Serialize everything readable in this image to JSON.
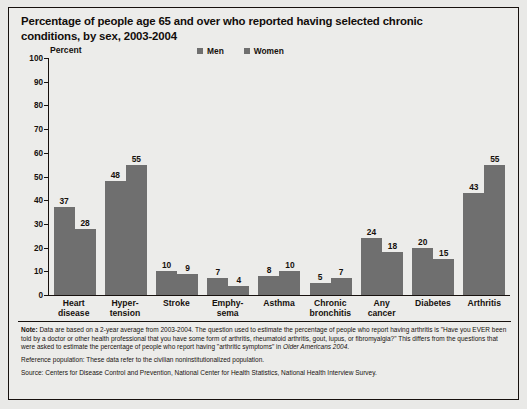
{
  "chart_data": {
    "type": "bar",
    "title": "Percentage of people age 65 and over who reported having selected chronic conditions, by sex, 2003-2004",
    "title_line1": "Percentage of people age 65 and over who reported having selected chronic",
    "title_line2": "conditions, by sex, 2003-2004",
    "ylabel": "Percent",
    "xlabel": "",
    "ylim": [
      0,
      100
    ],
    "yticks": [
      0,
      10,
      20,
      30,
      40,
      50,
      60,
      70,
      80,
      90,
      100
    ],
    "grid": false,
    "legend_position": "top-center",
    "categories": [
      "Heart disease",
      "Hyper- tension",
      "Stroke",
      "Emphy- sema",
      "Asthma",
      "Chronic bronchitis",
      "Any cancer",
      "Diabetes",
      "Arthritis"
    ],
    "category_lines": [
      [
        "Heart",
        "disease"
      ],
      [
        "Hyper-",
        "tension"
      ],
      [
        "Stroke",
        ""
      ],
      [
        "Emphy-",
        "sema"
      ],
      [
        "Asthma",
        ""
      ],
      [
        "Chronic",
        "bronchitis"
      ],
      [
        "Any",
        "cancer"
      ],
      [
        "Diabetes",
        ""
      ],
      [
        "Arthritis",
        ""
      ]
    ],
    "series": [
      {
        "name": "Men",
        "color": "#6f6f6f",
        "values": [
          37,
          48,
          10,
          7,
          8,
          5,
          24,
          20,
          43
        ]
      },
      {
        "name": "Women",
        "color": "#6f6f6f",
        "values": [
          28,
          55,
          9,
          4,
          10,
          7,
          18,
          15,
          55
        ]
      }
    ]
  },
  "notes": {
    "note_label": "Note:",
    "note_text": " Data are based on a 2-year average from 2003-2004. The question used to estimate the percentage of people who report having arthritis is \"Have you EVER been told by a doctor or other health professional that you have some form of arthritis, rheumatoid arthritis, gout, lupus, or fibromyalgia?\" This differs from the questions that were asked to estimate the percentage of people who report having \"arthritic symptoms\" in ",
    "note_italic": "Older Americans 2004",
    "note_tail": ".",
    "reference": "Reference population: These data refer to the civilian noninstitutionalized population.",
    "source": "Source:  Centers for Disease Control and Prevention, National Center for Health Statistics, National Health Interview Survey."
  }
}
